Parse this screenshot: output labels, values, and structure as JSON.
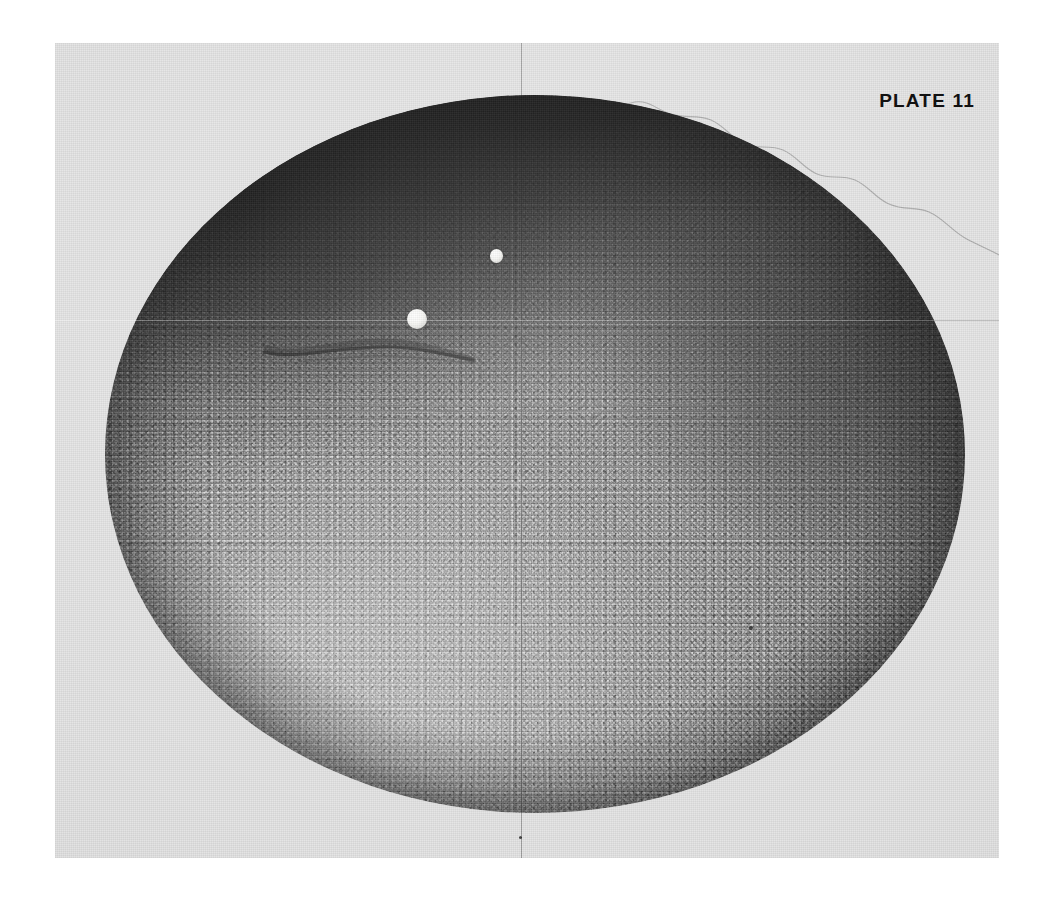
{
  "page": {
    "background_color": "#ffffff",
    "width": 1050,
    "height": 905
  },
  "plate": {
    "label": "PLATE 11",
    "label_color": "#111111",
    "paper_color": "#e3e3e3",
    "bounds": {
      "left": 55,
      "top": 43,
      "width": 944,
      "height": 815
    },
    "description": "Scanned monochrome photographic plate of a large elliptical specimen with radial granular texture"
  },
  "specimen": {
    "name": "elliptical-specimen",
    "bounds": {
      "left": 105,
      "top": 95,
      "width": 860,
      "height": 718
    },
    "dark_band_color": "#000000",
    "mid_tone_color": "#8a8a8a",
    "light_tone_color": "#bcbcbc",
    "texture": "granular-radial-mottle"
  },
  "features": {
    "bubbles": [
      {
        "name": "large-white-inclusion",
        "cx": 417,
        "cy": 319,
        "diameter": 20,
        "color": "#ffffff"
      },
      {
        "name": "small-white-inclusion",
        "cx": 496,
        "cy": 256,
        "diameter": 13,
        "color": "#f2f2ef"
      }
    ],
    "trail": {
      "name": "dark-comet-trail",
      "from_x": 417,
      "from_y": 319,
      "to_x": 243,
      "to_y": 303,
      "color": "#1a1a1a"
    },
    "specks": [
      {
        "name": "dust-speck-1",
        "cx": 751,
        "cy": 628,
        "size": 4
      },
      {
        "name": "dust-speck-2",
        "cx": 521,
        "cy": 838,
        "size": 3
      }
    ]
  },
  "reticle": {
    "name": "crosshair-reticle",
    "vertical_x": 521,
    "horizontal_y": 320,
    "vertical_color": "rgba(0,0,0,0.30)",
    "horizontal_color": "rgba(255,255,255,0.34)"
  },
  "halo": {
    "name": "scalloped-halo-contour",
    "color": "rgba(90,90,90,0.55)",
    "description": "Faint wavy scalloped outline tracing above the specimen limb"
  }
}
